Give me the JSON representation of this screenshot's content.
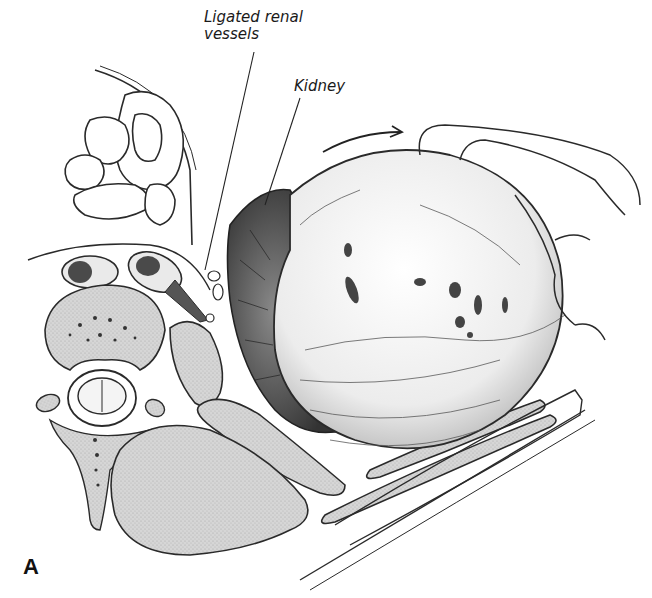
{
  "figure": {
    "panel_letter": "A",
    "labels": {
      "renal_vessels": "Ligated renal vessels",
      "kidney": "Kidney"
    },
    "structures": [
      "intestinal loops",
      "vertebral body",
      "spinal cord",
      "psoas muscle",
      "paraspinal muscle",
      "kidney",
      "renal mass",
      "abdominal wall muscles",
      "peritoneal reflection",
      "rotation arrow"
    ],
    "colors": {
      "line": "#2a2a2a",
      "muscle_fill": "#cfcfcf",
      "kidney_fill": "#5a5a5a",
      "mass_fill": "#f2f2f2",
      "background": "#ffffff"
    }
  }
}
